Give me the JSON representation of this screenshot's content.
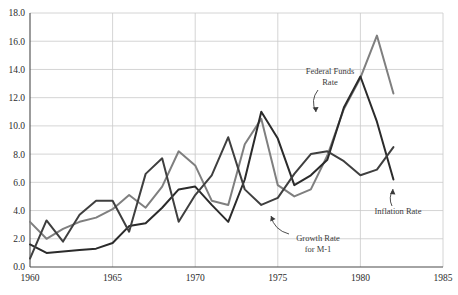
{
  "chart_data": {
    "type": "line",
    "title": "",
    "subtitle": "",
    "xlabel": "",
    "ylabel": "",
    "xlim": [
      1960,
      1985
    ],
    "ylim": [
      0.0,
      18.0
    ],
    "grid": true,
    "legend_position": "inline-annotations",
    "y_ticks": [
      "0.0",
      "2.0",
      "4.0",
      "6.0",
      "8.0",
      "10.0",
      "12.0",
      "14.0",
      "16.0",
      "18.0"
    ],
    "y_tick_values": [
      0,
      2,
      4,
      6,
      8,
      10,
      12,
      14,
      16,
      18
    ],
    "x_ticks": [
      "1960",
      "1965",
      "1970",
      "1975",
      "1980",
      "1985"
    ],
    "x_tick_values": [
      1960,
      1965,
      1970,
      1975,
      1980,
      1985
    ],
    "x": [
      1960,
      1961,
      1962,
      1963,
      1964,
      1965,
      1966,
      1967,
      1968,
      1969,
      1970,
      1971,
      1972,
      1973,
      1974,
      1975,
      1976,
      1977,
      1978,
      1979,
      1980,
      1981,
      1982
    ],
    "series": [
      {
        "name": "Federal Funds Rate",
        "color": "#7f7f7f",
        "values": [
          3.2,
          2.0,
          2.7,
          3.2,
          3.5,
          4.1,
          5.1,
          4.2,
          5.7,
          8.2,
          7.2,
          4.7,
          4.4,
          8.7,
          10.5,
          5.8,
          5.0,
          5.5,
          7.9,
          11.2,
          13.4,
          16.4,
          12.3
        ]
      },
      {
        "name": "Inflation Rate",
        "color": "#2b2b2b",
        "values": [
          1.6,
          1.0,
          1.1,
          1.2,
          1.3,
          1.7,
          2.9,
          3.1,
          4.2,
          5.5,
          5.7,
          4.4,
          3.2,
          6.2,
          11.0,
          9.1,
          5.8,
          6.5,
          7.6,
          11.3,
          13.5,
          10.3,
          6.2
        ]
      },
      {
        "name": "Growth Rate for M-1",
        "color": "#3f3f3f",
        "values": [
          0.6,
          3.3,
          1.8,
          3.7,
          4.7,
          4.7,
          2.5,
          6.6,
          7.7,
          3.2,
          5.1,
          6.5,
          9.2,
          5.5,
          4.4,
          4.9,
          6.6,
          8.0,
          8.2,
          7.5,
          6.5,
          6.9,
          8.5
        ]
      }
    ],
    "annotations": [
      {
        "text_line1": "Federal Funds",
        "text_line2": "Rate",
        "target_series": "Federal Funds Rate"
      },
      {
        "text_line1": "Growth Rate",
        "text_line2": "for M-1",
        "target_series": "Growth Rate for M-1"
      },
      {
        "text_line1": "Inflation Rate",
        "text_line2": "",
        "target_series": "Inflation Rate"
      }
    ],
    "colors": {
      "axis": "#4a4a4a",
      "grid": "#c9c9c9",
      "background": "#ffffff",
      "federal_funds": "#7f7f7f",
      "inflation": "#2b2b2b",
      "m1_growth": "#3f3f3f"
    }
  }
}
